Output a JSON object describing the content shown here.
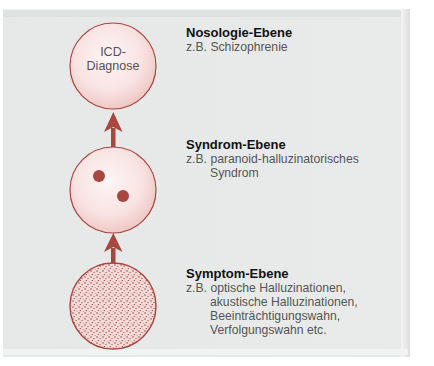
{
  "colors": {
    "accent": "#a8463f",
    "circle_fill_center": "#fdf3f3",
    "circle_fill_edge": "#f0c9c6",
    "panel_bg": "#e8eaea"
  },
  "diagram": {
    "nodes": [
      {
        "id": "nosology",
        "label_line1": "ICD-",
        "label_line2": "Diagnose"
      },
      {
        "id": "syndrome",
        "dots": 2
      },
      {
        "id": "symptom",
        "texture": "stippled"
      }
    ],
    "arrows": [
      {
        "from": "syndrome",
        "to": "nosology",
        "icon": "arrow-up-icon"
      },
      {
        "from": "symptom",
        "to": "syndrome",
        "icon": "arrow-up-icon"
      }
    ]
  },
  "levels": [
    {
      "title": "Nosologie-Ebene",
      "prefix": "z.B.",
      "lines": [
        "Schizophrenie"
      ]
    },
    {
      "title": "Syndrom-Ebene",
      "prefix": "z.B.",
      "lines": [
        "paranoid-halluzinatorisches",
        "Syndrom"
      ]
    },
    {
      "title": "Symptom-Ebene",
      "prefix": "z.B.",
      "lines": [
        "optische Halluzinationen,",
        "akustische Halluzinationen,",
        "Beeinträchtigungswahn,",
        "Verfolgungswahn etc."
      ]
    }
  ]
}
